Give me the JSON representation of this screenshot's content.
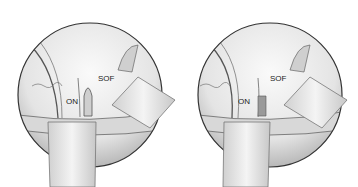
{
  "figure": {
    "panels": [
      {
        "id": "left",
        "labels": {
          "optic_nerve": "ON",
          "superior_orbital_fissure": "SOF"
        }
      },
      {
        "id": "right",
        "labels": {
          "optic_nerve": "ON",
          "superior_orbital_fissure": "SOF"
        }
      }
    ]
  }
}
